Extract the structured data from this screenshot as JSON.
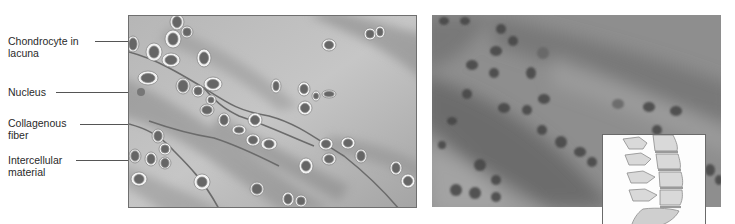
{
  "figure": {
    "type": "hyaline-cartilage-illustration",
    "labels": [
      {
        "line1": "Chondrocyte in",
        "line2": "lacuna"
      },
      {
        "line1": "Nucleus",
        "line2": ""
      },
      {
        "line1": "Collagenous",
        "line2": "fiber"
      },
      {
        "line1": "Intercellular",
        "line2": "material"
      }
    ],
    "panels": [
      {
        "name": "schematic-drawing"
      },
      {
        "name": "micrograph"
      },
      {
        "name": "spine-inset"
      }
    ]
  },
  "colors": {
    "matrix_light": "#c4c4c4",
    "matrix_dark": "#8a8a8a",
    "fiber": "#6d6d6d",
    "lacuna_rim": "#f2f2f2",
    "cell": "#6a6a6a",
    "micro_bg": "#8d8d8d"
  }
}
